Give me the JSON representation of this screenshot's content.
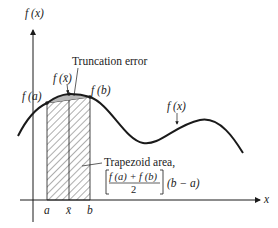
{
  "figure": {
    "y_axis_label": "f (x)",
    "x_axis_label": "x",
    "curve_label": "f (x)",
    "point_labels": {
      "fa": "f (a)",
      "fxbar": "f (x̄)",
      "fb": "f (b)"
    },
    "tick_labels": {
      "a": "a",
      "xbar": "x̄",
      "b": "b"
    },
    "annotations": {
      "truncation_error": "Truncation error",
      "trapezoid_area": "Trapezoid area,",
      "formula_numerator": "f (a) + f (b)",
      "formula_denominator": "2",
      "formula_factor": "(b − a)"
    },
    "colors": {
      "line": "#1a1a1a",
      "hatch": "#333333",
      "error_fill": "#b8b8b8"
    }
  }
}
